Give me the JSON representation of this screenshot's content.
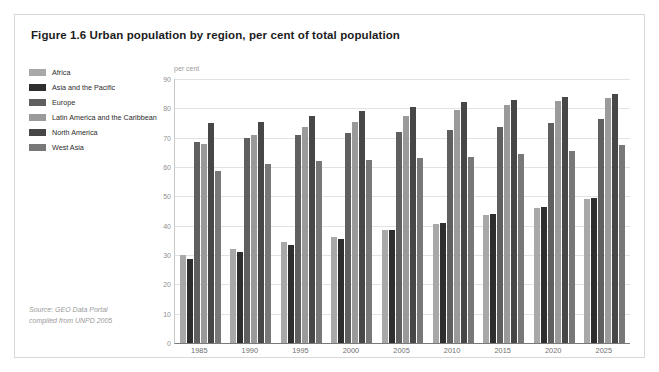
{
  "figure": {
    "title": "Figure 1.6 Urban population by region, per cent of total population",
    "source_line_1": "Source: GEO Data Portal",
    "source_line_2": "compiled from UNPD 2005",
    "border_color": "#d8d8d8",
    "background": "#ffffff"
  },
  "chart_data": {
    "type": "bar",
    "title": "Figure 1.6 Urban population by region, per cent of total population",
    "xlabel": "",
    "ylabel": "per cent",
    "ylim": [
      0,
      90
    ],
    "yticks": [
      0,
      10,
      20,
      30,
      40,
      50,
      60,
      70,
      80,
      90
    ],
    "grid": true,
    "legend_position": "left",
    "categories": [
      "1985",
      "1990",
      "1995",
      "2000",
      "2005",
      "2010",
      "2015",
      "2020",
      "2025"
    ],
    "series": [
      {
        "name": "Africa",
        "color": "#a8a8a8",
        "values": [
          30,
          32,
          34.5,
          36,
          38.5,
          40.5,
          43.5,
          46,
          49
        ]
      },
      {
        "name": "Asia and the Pacific",
        "color": "#2e2e2e",
        "values": [
          28.5,
          31,
          33.5,
          35.5,
          38.5,
          41,
          44,
          46.5,
          49.5
        ]
      },
      {
        "name": "Europe",
        "color": "#5f5f5f",
        "values": [
          68.5,
          70,
          71,
          71.5,
          72,
          72.5,
          73.5,
          75,
          76.5
        ]
      },
      {
        "name": "Latin America and the Caribbean",
        "color": "#9a9a9a",
        "values": [
          68,
          71,
          73.5,
          75.5,
          77.5,
          79.5,
          81,
          82.5,
          83.5
        ]
      },
      {
        "name": "North America",
        "color": "#474747",
        "values": [
          75,
          75.5,
          77.5,
          79,
          80.5,
          82,
          83,
          84,
          85
        ]
      },
      {
        "name": "West Asia",
        "color": "#787878",
        "values": [
          58.5,
          61,
          62,
          62.5,
          63,
          63.5,
          64.5,
          65.5,
          67.5
        ]
      }
    ]
  }
}
